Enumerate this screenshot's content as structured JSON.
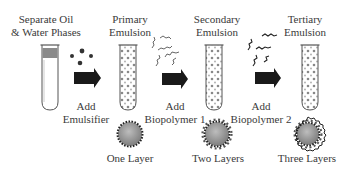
{
  "stages": [
    {
      "title_line1": "Separate Oil",
      "title_line2": "& Water Phases"
    },
    {
      "title_line1": "Primary",
      "title_line2": "Emulsion",
      "layer_label": "One Layer"
    },
    {
      "title_line1": "Secondary",
      "title_line2": "Emulsion",
      "layer_label": "Two Layers"
    },
    {
      "title_line1": "Tertiary",
      "title_line2": "Emulsion",
      "layer_label": "Three Layers"
    }
  ],
  "steps": [
    {
      "line1": "Add",
      "line2": "Emulsifier",
      "icon": "emulsifier-particles-icon"
    },
    {
      "line1": "Add",
      "line2": "Biopolymer 1",
      "icon": "biopolymer-chains-icon"
    },
    {
      "line1": "Add",
      "line2": "Biopolymer 2",
      "icon": "biopolymer-chains-icon"
    }
  ],
  "colors": {
    "arrow": "#1a1a1a",
    "tube_outline": "#555555",
    "oil_layer": "#8a8a8a",
    "droplet_core": "#9a9a9a",
    "text": "#3a3a3a"
  }
}
